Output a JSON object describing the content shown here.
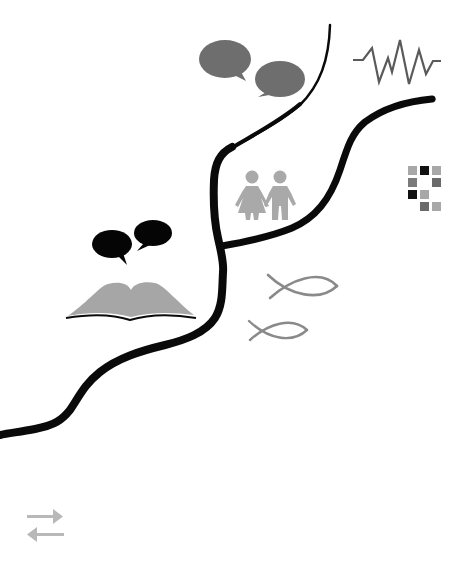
{
  "illustration": {
    "background": "#ffffff",
    "colors": {
      "path": "#0a0a0a",
      "gray_bubbles": "#6e6e6e",
      "black_bubbles": "#050505",
      "zigzag": "#5a5a5a",
      "couple": "#a9a9a9",
      "book_pages": "#a6a6a6",
      "book_edge": "#0a0a0a",
      "fish": "#8a8a8a",
      "arrows": "#b8b8b8",
      "grid_light": "#a8a8a8",
      "grid_mid": "#6a6a6a",
      "grid_dark": "#111111"
    },
    "icons": [
      "speech-bubbles-gray",
      "zigzag-waveform",
      "pixel-grid",
      "couple-holding-hands",
      "speech-bubbles-black",
      "open-book",
      "fish-symbol-large",
      "fish-symbol-small",
      "swap-arrows"
    ]
  }
}
